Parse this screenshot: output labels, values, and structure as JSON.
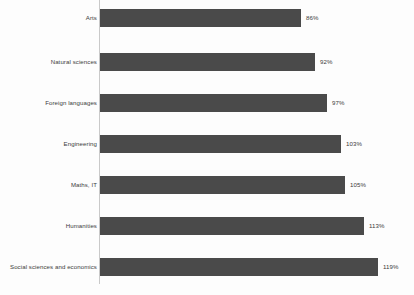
{
  "chart_data": {
    "type": "bar",
    "orientation": "horizontal",
    "title": "",
    "subtitle": "",
    "xlabel": "",
    "ylabel": "",
    "grid": false,
    "legend": null,
    "axis_line": "vertical category axis at left of bars",
    "xlim": [
      0,
      119
    ],
    "categories": [
      "Arts",
      "Natural sciences",
      "Foreign languages",
      "Engineering",
      "Maths, IT",
      "Humanities",
      "Social sciences and economics"
    ],
    "values": [
      86,
      92,
      97,
      103,
      105,
      113,
      119
    ],
    "data_labels": [
      "86%",
      "92%",
      "97%",
      "103%",
      "105%",
      "113%",
      "119%"
    ],
    "bar_color": "#4a4a4a",
    "background_color": "#fdfdfd",
    "axis_color": "#c9c9c9",
    "label_color": "#3c3c3c"
  },
  "bars": [
    {
      "label": "Arts",
      "value": 86,
      "value_label": "86%"
    },
    {
      "label": "Natural sciences",
      "value": 92,
      "value_label": "92%"
    },
    {
      "label": "Foreign languages",
      "value": 97,
      "value_label": "97%"
    },
    {
      "label": "Engineering",
      "value": 103,
      "value_label": "103%"
    },
    {
      "label": "Maths, IT",
      "value": 105,
      "value_label": "105%"
    },
    {
      "label": "Humanities",
      "value": 113,
      "value_label": "113%"
    },
    {
      "label": "Social sciences and economics",
      "value": 119,
      "value_label": "119%"
    }
  ]
}
